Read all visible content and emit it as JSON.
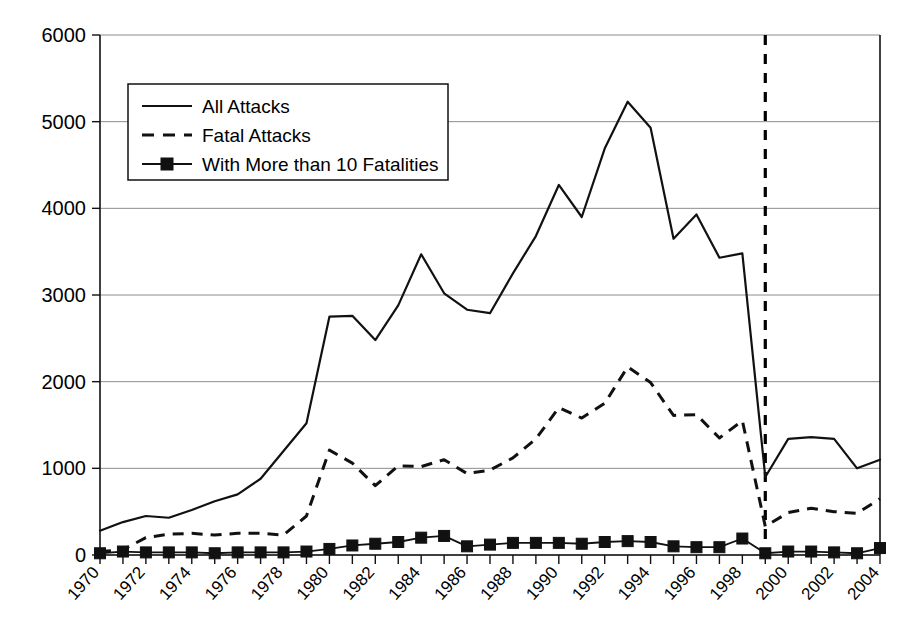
{
  "chart_data": {
    "type": "line",
    "title": "",
    "subtitle": "",
    "xlabel": "",
    "ylabel": "",
    "xlim": [
      1970,
      2004
    ],
    "ylim": [
      0,
      6000
    ],
    "grid": true,
    "legend_position": "upper-left",
    "x": [
      1970,
      1971,
      1972,
      1973,
      1974,
      1975,
      1976,
      1977,
      1978,
      1979,
      1980,
      1981,
      1982,
      1983,
      1984,
      1985,
      1986,
      1987,
      1988,
      1989,
      1990,
      1991,
      1992,
      1993,
      1994,
      1995,
      1996,
      1997,
      1998,
      1999,
      2000,
      2001,
      2002,
      2003,
      2004
    ],
    "series": [
      {
        "name": "All Attacks",
        "style": "solid",
        "values": [
          280,
          380,
          450,
          430,
          520,
          620,
          700,
          880,
          1200,
          1520,
          2750,
          2760,
          2480,
          2880,
          3470,
          3020,
          2830,
          2790,
          3250,
          3680,
          4270,
          3900,
          4690,
          5230,
          4930,
          3650,
          3930,
          3430,
          3480,
          900,
          1340,
          1360,
          1340,
          1000,
          1100
        ]
      },
      {
        "name": "Fatal Attacks",
        "style": "dashed",
        "values": [
          40,
          60,
          200,
          240,
          250,
          230,
          250,
          250,
          230,
          450,
          1210,
          1060,
          800,
          1030,
          1020,
          1100,
          940,
          980,
          1120,
          1340,
          1700,
          1580,
          1750,
          2170,
          1990,
          1610,
          1620,
          1350,
          1550,
          330,
          490,
          540,
          500,
          480,
          650
        ]
      },
      {
        "name": "With More than 10 Fatalities",
        "style": "solid-markers",
        "marker": "square",
        "values": [
          20,
          40,
          30,
          30,
          30,
          20,
          30,
          30,
          30,
          40,
          70,
          110,
          130,
          150,
          200,
          220,
          100,
          120,
          140,
          140,
          140,
          130,
          150,
          160,
          150,
          100,
          90,
          90,
          190,
          20,
          40,
          40,
          30,
          20,
          80
        ]
      }
    ],
    "y_ticks": [
      0,
      1000,
      2000,
      3000,
      4000,
      5000,
      6000
    ],
    "y_tick_labels": [
      "0",
      "1000",
      "2000",
      "3000",
      "4000",
      "5000",
      "6000"
    ],
    "x_tick_labels": [
      "1970",
      "1972",
      "1974",
      "1976",
      "1978",
      "1980",
      "1982",
      "1984",
      "1986",
      "1988",
      "1990",
      "1992",
      "1994",
      "1996",
      "1998",
      "2000",
      "2002",
      "2004"
    ],
    "x_tick_values": [
      1970,
      1972,
      1974,
      1976,
      1978,
      1980,
      1982,
      1984,
      1986,
      1988,
      1990,
      1992,
      1994,
      1996,
      1998,
      2000,
      2002,
      2004
    ],
    "annotations": [
      {
        "type": "vertical-dashed-line",
        "name": "data-break-marker",
        "x": 1999,
        "label": ""
      }
    ]
  },
  "legend": {
    "items": [
      {
        "label": "All Attacks",
        "style": "solid"
      },
      {
        "label": "Fatal Attacks",
        "style": "dashed"
      },
      {
        "label": "With More than 10 Fatalities",
        "style": "solid-markers"
      }
    ]
  },
  "colors": {
    "series": "#111111",
    "grid": "#8d8d8d",
    "axis": "#111111",
    "background": "#ffffff"
  }
}
